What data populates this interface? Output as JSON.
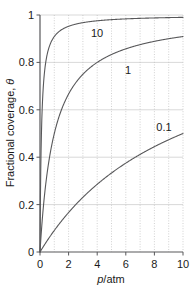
{
  "chart_data": {
    "type": "line",
    "title": "",
    "subtitle": "",
    "xlabel": "p/atm",
    "xlabel_italic_part": "p",
    "xlabel_rest": "/atm",
    "ylabel": "Fractional coverage, θ",
    "ylabel_text": "Fractional coverage, ",
    "ylabel_symbol": "θ",
    "xlim": [
      0,
      10
    ],
    "ylim": [
      0,
      1
    ],
    "xticks": [
      "0",
      "2",
      "4",
      "6",
      "8",
      "10"
    ],
    "xtick_values": [
      0,
      2,
      4,
      6,
      8,
      10
    ],
    "yticks": [
      "0",
      "0.2",
      "0.4",
      "0.6",
      "0.8",
      "1"
    ],
    "ytick_values": [
      0,
      0.2,
      0.4,
      0.6,
      0.8,
      1
    ],
    "grid": {
      "vertical": true,
      "vertical_style": "dotted",
      "vertical_interval": 1,
      "horizontal": true,
      "horizontal_style": "solid",
      "horizontal_interval": 0.2
    },
    "legend": "inline-curve-labels",
    "legend_position": "on-curve",
    "equation": "θ = Kp/(1 + Kp)",
    "series": [
      {
        "name": "10",
        "label": "10",
        "K": 10,
        "color": "#58585a",
        "label_x": 3.2,
        "label_y": 0.945,
        "x": [
          0,
          0.1,
          0.2,
          0.3,
          0.4,
          0.5,
          0.6,
          0.8,
          1.0,
          1.25,
          1.5,
          2.0,
          2.5,
          3.0,
          4.0,
          5.0,
          6.0,
          7.0,
          8.0,
          9.0,
          10.0
        ],
        "values": [
          0.0,
          0.5,
          0.667,
          0.75,
          0.8,
          0.833,
          0.857,
          0.889,
          0.909,
          0.926,
          0.938,
          0.952,
          0.962,
          0.968,
          0.976,
          0.98,
          0.984,
          0.986,
          0.988,
          0.989,
          0.99
        ]
      },
      {
        "name": "1",
        "label": "1",
        "K": 1,
        "color": "#58585a",
        "label_x": 6.1,
        "label_y": 0.8,
        "x": [
          0,
          0.25,
          0.5,
          0.75,
          1.0,
          1.5,
          2.0,
          2.5,
          3.0,
          3.5,
          4.0,
          5.0,
          6.0,
          7.0,
          8.0,
          9.0,
          10.0
        ],
        "values": [
          0.0,
          0.2,
          0.333,
          0.429,
          0.5,
          0.6,
          0.667,
          0.714,
          0.75,
          0.778,
          0.8,
          0.833,
          0.857,
          0.875,
          0.889,
          0.9,
          0.909
        ]
      },
      {
        "name": "0.1",
        "label": "0.1",
        "K": 0.1,
        "color": "#58585a",
        "label_x": 8.55,
        "label_y": 0.565,
        "x": [
          0,
          0.5,
          1.0,
          1.5,
          2.0,
          3.0,
          4.0,
          5.0,
          6.0,
          7.0,
          8.0,
          9.0,
          10.0
        ],
        "values": [
          0.0,
          0.048,
          0.091,
          0.13,
          0.167,
          0.231,
          0.286,
          0.333,
          0.375,
          0.412,
          0.444,
          0.474,
          0.5
        ]
      }
    ]
  },
  "colors": {
    "curve": "#58585a",
    "axis": "#58585a",
    "grid_horizontal": "#c8c8c8",
    "grid_vertical": "#bdbdbd",
    "text": "#1a1a1a",
    "background": "#ffffff"
  },
  "axis_labels": {
    "x": "p/atm",
    "y": "Fractional coverage, θ"
  },
  "x_tick_labels": {
    "t0": "0",
    "t1": "2",
    "t2": "4",
    "t3": "6",
    "t4": "8",
    "t5": "10"
  },
  "y_tick_labels": {
    "t0": "0",
    "t1": "0.2",
    "t2": "0.4",
    "t3": "0.6",
    "t4": "0.8",
    "t5": "1"
  },
  "curve_labels": {
    "c10": "10",
    "c1": "1",
    "c01": "0.1"
  }
}
